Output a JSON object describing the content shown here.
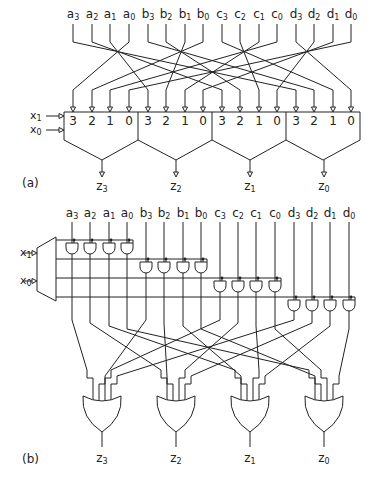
{
  "figure": {
    "part_a": {
      "label": "(a)",
      "inputs": [
        {
          "name": "a",
          "sub": "3",
          "x": 73
        },
        {
          "name": "a",
          "sub": "2",
          "x": 92
        },
        {
          "name": "a",
          "sub": "1",
          "x": 110
        },
        {
          "name": "a",
          "sub": "0",
          "x": 129
        },
        {
          "name": "b",
          "sub": "3",
          "x": 148
        },
        {
          "name": "b",
          "sub": "2",
          "x": 166
        },
        {
          "name": "b",
          "sub": "1",
          "x": 185
        },
        {
          "name": "b",
          "sub": "0",
          "x": 203
        },
        {
          "name": "c",
          "sub": "3",
          "x": 222
        },
        {
          "name": "c",
          "sub": "2",
          "x": 240
        },
        {
          "name": "c",
          "sub": "1",
          "x": 259
        },
        {
          "name": "c",
          "sub": "0",
          "x": 277
        },
        {
          "name": "d",
          "sub": "3",
          "x": 296
        },
        {
          "name": "d",
          "sub": "2",
          "x": 314
        },
        {
          "name": "d",
          "sub": "1",
          "x": 333
        },
        {
          "name": "d",
          "sub": "0",
          "x": 351
        }
      ],
      "select_inputs": [
        {
          "name": "x",
          "sub": "1"
        },
        {
          "name": "x",
          "sub": "0"
        }
      ],
      "mux_port_labels": [
        "3",
        "2",
        "1",
        "0",
        "3",
        "2",
        "1",
        "0",
        "3",
        "2",
        "1",
        "0",
        "3",
        "2",
        "1",
        "0"
      ],
      "outputs": [
        {
          "name": "z",
          "sub": "3"
        },
        {
          "name": "z",
          "sub": "2"
        },
        {
          "name": "z",
          "sub": "1"
        },
        {
          "name": "z",
          "sub": "0"
        }
      ]
    },
    "part_b": {
      "label": "(b)",
      "inputs": [
        {
          "name": "a",
          "sub": "3",
          "x": 72
        },
        {
          "name": "a",
          "sub": "2",
          "x": 90
        },
        {
          "name": "a",
          "sub": "1",
          "x": 109
        },
        {
          "name": "a",
          "sub": "0",
          "x": 127
        },
        {
          "name": "b",
          "sub": "3",
          "x": 146
        },
        {
          "name": "b",
          "sub": "2",
          "x": 164
        },
        {
          "name": "b",
          "sub": "1",
          "x": 183
        },
        {
          "name": "b",
          "sub": "0",
          "x": 201
        },
        {
          "name": "c",
          "sub": "3",
          "x": 220
        },
        {
          "name": "c",
          "sub": "2",
          "x": 238
        },
        {
          "name": "c",
          "sub": "1",
          "x": 256
        },
        {
          "name": "c",
          "sub": "0",
          "x": 275
        },
        {
          "name": "d",
          "sub": "3",
          "x": 294
        },
        {
          "name": "d",
          "sub": "2",
          "x": 312
        },
        {
          "name": "d",
          "sub": "1",
          "x": 330
        },
        {
          "name": "d",
          "sub": "0",
          "x": 349
        }
      ],
      "select_inputs": [
        {
          "name": "x",
          "sub": "1"
        },
        {
          "name": "x",
          "sub": "0"
        }
      ],
      "outputs": [
        {
          "name": "z",
          "sub": "3"
        },
        {
          "name": "z",
          "sub": "2"
        },
        {
          "name": "z",
          "sub": "1"
        },
        {
          "name": "z",
          "sub": "0"
        }
      ]
    },
    "colors": {
      "ink": "#222222",
      "background": "#ffffff"
    }
  }
}
